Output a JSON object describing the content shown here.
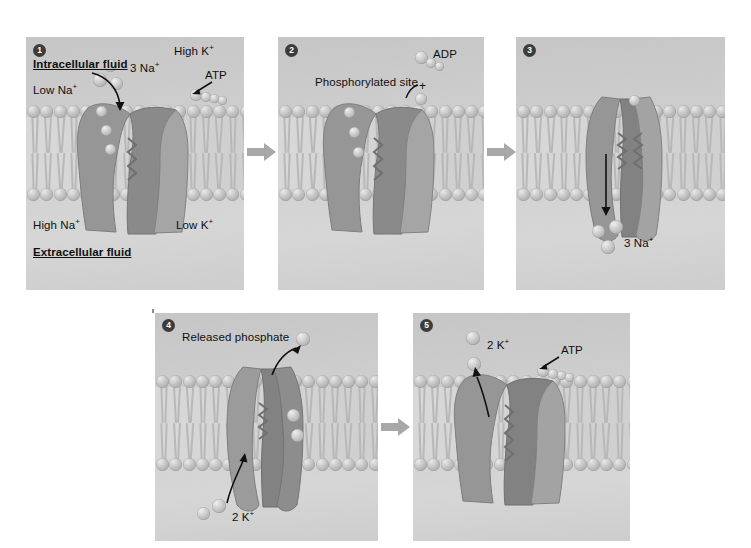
{
  "figure": {
    "colors": {
      "panel_background": "#cfcfcf",
      "protein_dark": "#8e8e8e",
      "protein_light": "#b0b0b0",
      "ion_sphere": "#c8c8c8",
      "text": "#101010",
      "badge": "#3c3c3c",
      "arrow": "#9e9e9e"
    }
  },
  "panels": [
    {
      "number": "1",
      "labels": {
        "compartment_top": "Intracellular fluid",
        "compartment_bottom": "Extracellular fluid",
        "low_na": "Low Na",
        "low_na_sup": "+",
        "high_k": "High K",
        "high_k_sup": "+",
        "high_na": "High Na",
        "high_na_sup": "+",
        "low_k": "Low K",
        "low_k_sup": "+",
        "ions": "3 Na",
        "ions_sup": "+",
        "atp": "ATP"
      }
    },
    {
      "number": "2",
      "labels": {
        "phosphorylated_site": "Phosphorylated site",
        "adp": "ADP",
        "plus": "+"
      }
    },
    {
      "number": "3",
      "labels": {
        "ions": "3 Na",
        "ions_sup": "+"
      }
    },
    {
      "number": "4",
      "labels": {
        "released_phosphate": "Released phosphate",
        "ions": "2 K",
        "ions_sup": "+"
      }
    },
    {
      "number": "5",
      "labels": {
        "ions": "2 K",
        "ions_sup": "+",
        "atp": "ATP"
      }
    }
  ],
  "flow_arrows": [
    {
      "from": "1",
      "to": "2"
    },
    {
      "from": "2",
      "to": "3"
    },
    {
      "from": "4",
      "to": "5"
    }
  ]
}
